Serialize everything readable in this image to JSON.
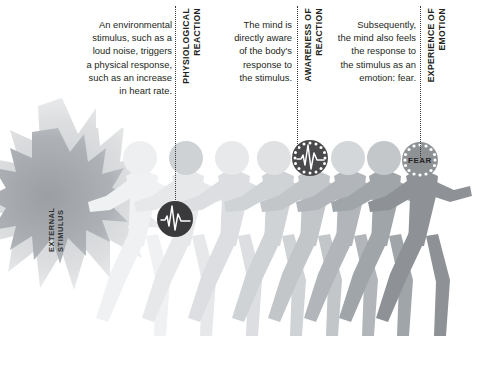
{
  "figure": {
    "background_color": "#ffffff"
  },
  "external_stimulus": {
    "label": "EXTERNAL\nSTIMULUS",
    "burst_outer_color": "#d6d8da",
    "burst_inner_color": "#a9adb1"
  },
  "stages": [
    {
      "id": "physiological-reaction",
      "paragraph": "An environmental\nstimulus, such as a\nloud noise, triggers\na physical response,\nsuch as an increase\nin heart rate.",
      "label": "PHYSIOLOGICAL\nREACTION",
      "badge": {
        "kind": "heartbeat",
        "text": "",
        "fill": "#3a3a3c",
        "line_color": "#ffffff",
        "has_dot_ring": false
      }
    },
    {
      "id": "awareness-of-reaction",
      "paragraph": "The mind is\ndirectly aware\nof the body's\nresponse to\nthe stimulus.",
      "label": "AWARENESS OF\nREACTION",
      "badge": {
        "kind": "heartbeat",
        "text": "",
        "fill": "#4a4a4c",
        "line_color": "#ffffff",
        "has_dot_ring": true
      }
    },
    {
      "id": "experience-of-emotion",
      "paragraph": "Subsequently,\nthe mind also feels\nthe response to\nthe stimulus as an\nemotion: fear.",
      "label": "EXPERIENCE OF\nEMOTION",
      "badge": {
        "kind": "text",
        "text": "FEAR",
        "fill": "#8e9295",
        "line_color": "#2a2a2a",
        "has_dot_ring": true
      }
    }
  ],
  "runners": {
    "count": 8,
    "description": "Row of angular running figures progressing from pale to dark gray, left to right.",
    "shades": [
      "#f2f3f4",
      "#e9eaec",
      "#e0e2e4",
      "#d3d6d8",
      "#c6cacc",
      "#b6babd",
      "#a2a7ab",
      "#8e9295"
    ],
    "head_centers_x": [
      140,
      186,
      232,
      275,
      310,
      348,
      383,
      420
    ],
    "head_center_y": 158,
    "head_radius": 17
  },
  "colors": {
    "text": "#231f20",
    "dotted_line": "#3a3a3a",
    "badge_dark": "#3a3a3c",
    "badge_mid": "#8e9295"
  }
}
